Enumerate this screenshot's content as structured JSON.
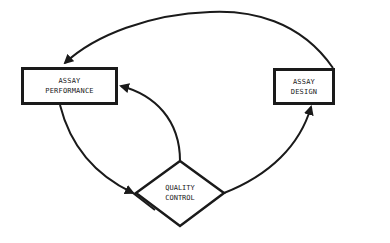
{
  "diagram": {
    "type": "flowchart-cycle",
    "colors": {
      "stroke": "#1a1a1a",
      "background": "#ffffff"
    },
    "nodes": [
      {
        "id": "assay-performance",
        "shape": "rectangle",
        "lines": [
          "ASSAY",
          "PERFORMANCE"
        ]
      },
      {
        "id": "assay-design",
        "shape": "rectangle",
        "lines": [
          "ASSAY",
          "DESIGN"
        ]
      },
      {
        "id": "quality-control",
        "shape": "diamond",
        "lines": [
          "QUALITY",
          "CONTROL"
        ]
      }
    ],
    "edges": [
      {
        "from": "assay-design",
        "to": "assay-performance",
        "route": "top arc"
      },
      {
        "from": "assay-performance",
        "to": "quality-control",
        "route": "lower left curve"
      },
      {
        "from": "quality-control",
        "to": "assay-performance",
        "route": "inner curve up"
      },
      {
        "from": "quality-control",
        "to": "assay-design",
        "route": "lower right curve"
      }
    ]
  }
}
